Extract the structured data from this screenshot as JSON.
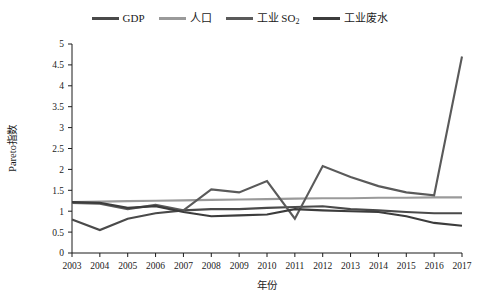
{
  "chart_data": {
    "type": "line",
    "title": "",
    "xlabel": "年份",
    "ylabel": "Pareto指数",
    "x": [
      2003,
      2004,
      2005,
      2006,
      2007,
      2008,
      2009,
      2010,
      2011,
      2012,
      2013,
      2014,
      2015,
      2016,
      2017
    ],
    "xtick_labels": [
      "2003",
      "2004",
      "2005",
      "2006",
      "2007",
      "2008",
      "2009",
      "2010",
      "2011",
      "2012",
      "2013",
      "2014",
      "2015",
      "2016",
      "2017"
    ],
    "ylim": [
      0,
      5
    ],
    "ytick_labels": [
      "0",
      "0.5",
      "1",
      "1.5",
      "2",
      "2.5",
      "3",
      "3.5",
      "4",
      "4.5",
      "5"
    ],
    "ytick_values": [
      0,
      0.5,
      1,
      1.5,
      2,
      2.5,
      3,
      3.5,
      4,
      4.5,
      5
    ],
    "grid": false,
    "legend_position": "top-center",
    "series": [
      {
        "name": "GDP",
        "color": "#4a4a4a",
        "values": [
          0.8,
          0.55,
          0.82,
          0.95,
          1.02,
          1.05,
          1.05,
          1.08,
          1.1,
          1.12,
          1.05,
          1.02,
          0.98,
          0.95,
          0.95
        ]
      },
      {
        "name": "人口",
        "color": "#9a9a9a",
        "values": [
          1.22,
          1.23,
          1.24,
          1.25,
          1.26,
          1.27,
          1.28,
          1.29,
          1.3,
          1.31,
          1.31,
          1.32,
          1.32,
          1.33,
          1.33
        ]
      },
      {
        "name": "工业 SO₂",
        "color": "#5a5a5a",
        "values": [
          1.2,
          1.18,
          1.05,
          1.15,
          1.02,
          1.52,
          1.45,
          1.72,
          0.82,
          2.08,
          1.82,
          1.6,
          1.45,
          1.38,
          4.7
        ]
      },
      {
        "name": "工业废水",
        "color": "#3c3c3c",
        "values": [
          1.22,
          1.2,
          1.08,
          1.12,
          0.98,
          0.88,
          0.9,
          0.92,
          1.05,
          1.02,
          1.0,
          0.98,
          0.88,
          0.72,
          0.65
        ]
      }
    ]
  },
  "legend": {
    "items": [
      {
        "label": "GDP",
        "color": "#4a4a4a"
      },
      {
        "label": "人口",
        "color": "#9a9a9a"
      },
      {
        "label": "工业 SO",
        "sub": "2",
        "color": "#5a5a5a"
      },
      {
        "label": "工业废水",
        "color": "#3c3c3c"
      }
    ]
  },
  "axes": {
    "y_title": "Pareto指数",
    "x_title": "年份"
  }
}
